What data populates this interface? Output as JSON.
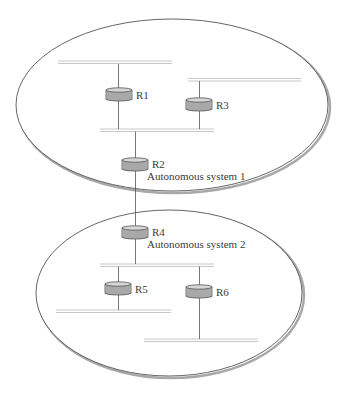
{
  "diagram": {
    "type": "network-topology",
    "colors": {
      "background": "#ffffff",
      "ellipse_stroke": "#555555",
      "ellipse_shadow": "#a8a8a8",
      "bus": "#c8c8c8",
      "link": "#555555",
      "router_body": "#a9a9a9",
      "router_top": "#d6d6d6",
      "router_stroke": "#555555",
      "text": "#3a3a3a"
    },
    "systems": [
      {
        "id": "as1",
        "label": "Autonomous system 1"
      },
      {
        "id": "as2",
        "label": "Autonomous system 2"
      }
    ],
    "routers": [
      {
        "id": "R1",
        "label": "R1"
      },
      {
        "id": "R2",
        "label": "R2"
      },
      {
        "id": "R3",
        "label": "R3"
      },
      {
        "id": "R4",
        "label": "R4"
      },
      {
        "id": "R5",
        "label": "R5"
      },
      {
        "id": "R6",
        "label": "R6"
      }
    ],
    "edges": [
      {
        "from": "R1",
        "to": "as1-bus-top"
      },
      {
        "from": "R1",
        "to": "as1-bus-middle"
      },
      {
        "from": "R3",
        "to": "as1-bus-right"
      },
      {
        "from": "R3",
        "to": "as1-bus-middle"
      },
      {
        "from": "R2",
        "to": "as1-bus-middle"
      },
      {
        "from": "R2",
        "to": "R4"
      },
      {
        "from": "R4",
        "to": "as2-bus-top"
      },
      {
        "from": "R5",
        "to": "as2-bus-top"
      },
      {
        "from": "R5",
        "to": "as2-bus-left"
      },
      {
        "from": "R6",
        "to": "as2-bus-top"
      },
      {
        "from": "R6",
        "to": "as2-bus-bottom"
      }
    ]
  }
}
